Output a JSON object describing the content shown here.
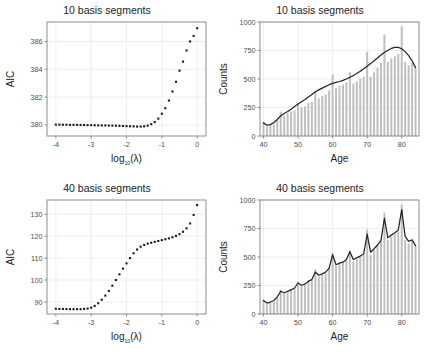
{
  "figure": {
    "width": 427,
    "height": 358,
    "background": "#ffffff",
    "panel_border_color": "#808080",
    "grid_color": "#ebebeb",
    "point_color": "#1a1a1a",
    "bar_color": "#bfbfbf",
    "curve_color": "#262626"
  },
  "panels": [
    {
      "id": "top-left",
      "title": "10 basis segments",
      "xlabel_main": "log",
      "xlabel_sub": "10",
      "xlabel_tail": "(λ)",
      "ylabel": "AIC"
    },
    {
      "id": "top-right",
      "title": "10 basis segments",
      "xlabel_main": "Age",
      "ylabel": "Counts"
    },
    {
      "id": "bottom-left",
      "title": "40 basis segments",
      "xlabel_main": "log",
      "xlabel_sub": "10",
      "xlabel_tail": "(λ)",
      "ylabel": "AIC"
    },
    {
      "id": "bottom-right",
      "title": "40 basis segments",
      "xlabel_main": "Age",
      "ylabel": "Counts"
    }
  ],
  "chart_data": [
    {
      "type": "scatter",
      "id": "aic-10-basis",
      "title": "10 basis segments",
      "xlabel": "log10(lambda)",
      "ylabel": "AIC",
      "xlim": [
        -4.25,
        0.25
      ],
      "ylim": [
        379.2,
        387.4
      ],
      "xticks": [
        -4,
        -3,
        -2,
        -1,
        0
      ],
      "xtick_labels": [
        "-4",
        "-3",
        "-2",
        "-1",
        "0"
      ],
      "yticks": [
        380,
        382,
        384,
        386
      ],
      "ytick_labels": [
        "380",
        "382",
        "384",
        "386"
      ],
      "grid": true,
      "legend": "none",
      "x": [
        -4.0,
        -3.9,
        -3.8,
        -3.7,
        -3.6,
        -3.5,
        -3.4,
        -3.3,
        -3.2,
        -3.1,
        -3.0,
        -2.9,
        -2.8,
        -2.7,
        -2.6,
        -2.5,
        -2.4,
        -2.3,
        -2.2,
        -2.1,
        -2.0,
        -1.9,
        -1.8,
        -1.7,
        -1.6,
        -1.5,
        -1.4,
        -1.3,
        -1.2,
        -1.1,
        -1.0,
        -0.9,
        -0.8,
        -0.7,
        -0.6,
        -0.5,
        -0.4,
        -0.3,
        -0.2,
        -0.1,
        0.0
      ],
      "y": [
        380.02,
        380.02,
        380.01,
        380.01,
        380.0,
        380.0,
        380.0,
        379.99,
        379.99,
        379.98,
        379.98,
        379.97,
        379.97,
        379.96,
        379.96,
        379.95,
        379.95,
        379.94,
        379.93,
        379.92,
        379.91,
        379.9,
        379.89,
        379.88,
        379.88,
        379.9,
        379.95,
        380.05,
        380.2,
        380.45,
        380.8,
        381.2,
        381.75,
        382.4,
        383.1,
        383.9,
        384.55,
        385.35,
        386.0,
        386.4,
        386.95
      ]
    },
    {
      "type": "bar",
      "id": "counts-10-basis",
      "title": "10 basis segments",
      "xlabel": "Age",
      "ylabel": "Counts",
      "xlim": [
        39.0,
        85.0
      ],
      "ylim": [
        0,
        1000
      ],
      "xticks": [
        40,
        50,
        60,
        70,
        80
      ],
      "xtick_labels": [
        "40",
        "50",
        "60",
        "70",
        "80"
      ],
      "yticks": [
        0,
        250,
        500,
        750,
        1000
      ],
      "ytick_labels": [
        "0",
        "250",
        "500",
        "750",
        "1000"
      ],
      "grid": true,
      "legend": "none",
      "categories": [
        40,
        41,
        42,
        43,
        44,
        45,
        46,
        47,
        48,
        49,
        50,
        51,
        52,
        53,
        54,
        55,
        56,
        57,
        58,
        59,
        60,
        61,
        62,
        63,
        64,
        65,
        66,
        67,
        68,
        69,
        70,
        71,
        72,
        73,
        74,
        75,
        76,
        77,
        78,
        79,
        80,
        81,
        82,
        83,
        84
      ],
      "values": [
        125,
        85,
        100,
        110,
        140,
        215,
        180,
        200,
        215,
        225,
        285,
        250,
        260,
        290,
        300,
        390,
        330,
        350,
        365,
        400,
        540,
        420,
        440,
        450,
        470,
        560,
        460,
        480,
        500,
        520,
        740,
        520,
        560,
        600,
        640,
        890,
        650,
        680,
        700,
        720,
        960,
        650,
        620,
        640,
        600
      ],
      "series": [
        {
          "name": "P-spline fit (10 segments)",
          "type": "line",
          "x": [
            40,
            41,
            42,
            43,
            44,
            45,
            46,
            47,
            48,
            49,
            50,
            51,
            52,
            53,
            54,
            55,
            56,
            57,
            58,
            59,
            60,
            61,
            62,
            63,
            64,
            65,
            66,
            67,
            68,
            69,
            70,
            71,
            72,
            73,
            74,
            75,
            76,
            77,
            78,
            79,
            80,
            81,
            82,
            83,
            84
          ],
          "values": [
            115,
            95,
            100,
            118,
            145,
            178,
            198,
            215,
            235,
            258,
            280,
            300,
            320,
            342,
            365,
            388,
            405,
            420,
            435,
            450,
            462,
            470,
            478,
            488,
            500,
            515,
            530,
            548,
            568,
            590,
            612,
            635,
            660,
            685,
            710,
            733,
            752,
            768,
            778,
            778,
            765,
            740,
            705,
            660,
            600
          ]
        }
      ]
    },
    {
      "type": "scatter",
      "id": "aic-40-basis",
      "title": "40 basis segments",
      "xlabel": "log10(lambda)",
      "ylabel": "AIC",
      "xlim": [
        -4.25,
        0.25
      ],
      "ylim": [
        84.5,
        136.5
      ],
      "xticks": [
        -4,
        -3,
        -2,
        -1,
        0
      ],
      "xtick_labels": [
        "-4",
        "-3",
        "-2",
        "-1",
        "0"
      ],
      "yticks": [
        90,
        100,
        110,
        120,
        130
      ],
      "ytick_labels": [
        "90",
        "100",
        "110",
        "120",
        "130"
      ],
      "grid": true,
      "legend": "none",
      "x": [
        -4.0,
        -3.9,
        -3.8,
        -3.7,
        -3.6,
        -3.5,
        -3.4,
        -3.3,
        -3.2,
        -3.1,
        -3.0,
        -2.9,
        -2.8,
        -2.7,
        -2.6,
        -2.5,
        -2.4,
        -2.3,
        -2.2,
        -2.1,
        -2.0,
        -1.9,
        -1.8,
        -1.7,
        -1.6,
        -1.5,
        -1.4,
        -1.3,
        -1.2,
        -1.1,
        -1.0,
        -0.9,
        -0.8,
        -0.7,
        -0.6,
        -0.5,
        -0.4,
        -0.3,
        -0.2,
        -0.1,
        0.0
      ],
      "y": [
        86.9,
        86.8,
        86.8,
        86.75,
        86.7,
        86.7,
        86.7,
        86.7,
        86.8,
        87.0,
        87.4,
        88.2,
        89.4,
        91.0,
        92.9,
        95.0,
        97.4,
        100.0,
        102.6,
        105.2,
        107.6,
        110.0,
        112.2,
        113.9,
        115.2,
        116.0,
        116.6,
        117.0,
        117.4,
        117.8,
        118.2,
        118.6,
        119.0,
        119.5,
        120.1,
        120.9,
        122.0,
        123.6,
        125.8,
        129.7,
        134.2
      ]
    },
    {
      "type": "bar",
      "id": "counts-40-basis",
      "title": "40 basis segments",
      "xlabel": "Age",
      "ylabel": "Counts",
      "xlim": [
        39.0,
        85.0
      ],
      "ylim": [
        0,
        1000
      ],
      "xticks": [
        40,
        50,
        60,
        70,
        80
      ],
      "xtick_labels": [
        "40",
        "50",
        "60",
        "70",
        "80"
      ],
      "yticks": [
        0,
        250,
        500,
        750,
        1000
      ],
      "ytick_labels": [
        "0",
        "250",
        "500",
        "750",
        "1000"
      ],
      "grid": true,
      "legend": "none",
      "categories": [
        40,
        41,
        42,
        43,
        44,
        45,
        46,
        47,
        48,
        49,
        50,
        51,
        52,
        53,
        54,
        55,
        56,
        57,
        58,
        59,
        60,
        61,
        62,
        63,
        64,
        65,
        66,
        67,
        68,
        69,
        70,
        71,
        72,
        73,
        74,
        75,
        76,
        77,
        78,
        79,
        80,
        81,
        82,
        83,
        84
      ],
      "values": [
        125,
        85,
        100,
        110,
        140,
        215,
        180,
        200,
        215,
        225,
        285,
        250,
        260,
        290,
        300,
        390,
        330,
        350,
        365,
        400,
        540,
        420,
        440,
        450,
        470,
        560,
        460,
        480,
        500,
        520,
        740,
        520,
        560,
        600,
        640,
        890,
        650,
        680,
        700,
        720,
        960,
        650,
        620,
        640,
        600
      ],
      "series": [
        {
          "name": "P-spline fit (40 segments)",
          "type": "line",
          "x": [
            40,
            41,
            42,
            43,
            44,
            45,
            46,
            47,
            48,
            49,
            50,
            51,
            52,
            53,
            54,
            55,
            56,
            57,
            58,
            59,
            60,
            61,
            62,
            63,
            64,
            65,
            66,
            67,
            68,
            69,
            70,
            71,
            72,
            73,
            74,
            75,
            76,
            77,
            78,
            79,
            80,
            81,
            82,
            83,
            84
          ],
          "values": [
            118,
            96,
            105,
            118,
            150,
            200,
            186,
            200,
            212,
            228,
            272,
            252,
            262,
            288,
            302,
            368,
            340,
            352,
            368,
            402,
            520,
            432,
            446,
            455,
            478,
            545,
            478,
            492,
            508,
            528,
            700,
            542,
            572,
            605,
            645,
            840,
            668,
            692,
            712,
            735,
            915,
            680,
            638,
            650,
            600
          ]
        }
      ]
    }
  ]
}
